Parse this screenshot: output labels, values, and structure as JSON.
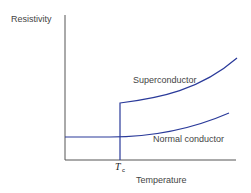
{
  "diagram": {
    "y_axis_label": "Resistivity",
    "x_axis_label": "Temperature",
    "critical_temp_label": "T",
    "critical_temp_subscript": "c",
    "curves": [
      {
        "name": "Superconductor",
        "label": "Superconductor"
      },
      {
        "name": "Normal conductor",
        "label": "Normal conductor"
      }
    ],
    "colors": {
      "curve": "#2a3a9a",
      "axis": "#555555"
    }
  }
}
